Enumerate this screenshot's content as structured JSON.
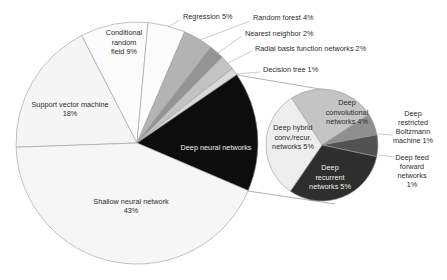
{
  "figure": {
    "background": "#ffffff"
  },
  "chart_data": [
    {
      "type": "pie",
      "name": "machine-learning-methods-main-pie",
      "categories": [
        "Support vector machine",
        "Conditional random field",
        "Regression",
        "Random forest",
        "Nearest neighbor",
        "Radial basis function networks",
        "Decision tree",
        "Deep neural networks",
        "Shallow neural network"
      ],
      "values": [
        18,
        9,
        5,
        4,
        2,
        2,
        1,
        16,
        43
      ],
      "unit": "%",
      "legend": "none",
      "labels_shown": [
        "Support vector machine 18%",
        "Conditional random field 9%",
        "Regression 5%",
        "Random forest 4%",
        "Nearest neighbor 2%",
        "Radial basis function networks 2%",
        "Decision tree 1%",
        "Deep neural networks",
        "Shallow neural network 43%"
      ]
    },
    {
      "type": "pie",
      "name": "deep-neural-networks-breakdown-sub-pie",
      "categories": [
        "Deep convolutional networks",
        "Deep restricted Boltzmann machine",
        "Deep feed forward networks",
        "Deep recurrent networks",
        "Deep hybrid conv./recur. networks"
      ],
      "values": [
        4,
        1,
        1,
        5,
        5
      ],
      "unit": "% of total",
      "legend": "none",
      "labels_shown": [
        "Deep convolutional networks 4%",
        "Deep restricted Boltzmann machine 1%",
        "Deep feed forward networks 1%",
        "Deep recurrent networks 5%",
        "Deep hybrid conv./recur. networks 5%"
      ]
    }
  ],
  "render": {
    "canvas": {
      "width": 447,
      "height": 280
    },
    "slice_stroke": "#9b9b9b",
    "leader_color": "#a8a8a8",
    "connector_color": "#8f8f8f",
    "dark_text": "#2d2d2d",
    "light_text": "#ededed",
    "pies": [
      {
        "name": "main-pie",
        "cx": 137,
        "cy": 143,
        "r": 121,
        "start": 268,
        "total": 100,
        "slices": [
          {
            "id": "support-vector-machine",
            "pct": 18,
            "fill": "#f5f5f5"
          },
          {
            "id": "conditional-random-field",
            "pct": 9,
            "fill": "#fbfbfb"
          },
          {
            "id": "regression",
            "pct": 5,
            "fill": "#fbfbfb"
          },
          {
            "id": "random-forest",
            "pct": 4,
            "fill": "#b3b3b3"
          },
          {
            "id": "nearest-neighbor",
            "pct": 2,
            "fill": "#949494"
          },
          {
            "id": "radial-basis-function-networks",
            "pct": 2,
            "fill": "#c3c3c3"
          },
          {
            "id": "decision-tree",
            "pct": 1,
            "fill": "#dadada"
          },
          {
            "id": "deep-neural-networks",
            "pct": 16,
            "fill": "#0d0d0d"
          },
          {
            "id": "shallow-neural-network",
            "pct": 43,
            "fill": "#f6f6f6"
          }
        ]
      },
      {
        "name": "sub-pie",
        "cx": 322,
        "cy": 145,
        "r": 56,
        "start": 327,
        "total": 16,
        "slices": [
          {
            "id": "deep-convolutional-networks",
            "pct": 4,
            "fill": "#c4c4c4"
          },
          {
            "id": "deep-restricted-boltzmann-machine",
            "pct": 1,
            "fill": "#8f8f8f"
          },
          {
            "id": "deep-feed-forward-networks",
            "pct": 1,
            "fill": "#525252"
          },
          {
            "id": "deep-recurrent-networks",
            "pct": 5,
            "fill": "#2e2e2e"
          },
          {
            "id": "deep-hybrid-networks",
            "pct": 5,
            "fill": "#ededed"
          }
        ]
      }
    ],
    "inside_labels": [
      {
        "id": "support-vector-machine",
        "lines": [
          "Support vector machine",
          "18%"
        ],
        "x": 70,
        "y": 109,
        "color": "#2d2d2d"
      },
      {
        "id": "conditional-random-field",
        "lines": [
          "Conditional",
          "random",
          "field 9%"
        ],
        "x": 124,
        "y": 42,
        "color": "#2d2d2d"
      },
      {
        "id": "shallow-neural-network",
        "lines": [
          "Shallow neural network",
          "43%"
        ],
        "x": 131,
        "y": 206,
        "color": "#2d2d2d"
      },
      {
        "id": "deep-neural-networks",
        "lines": [
          "Deep neural networks"
        ],
        "x": 216,
        "y": 147,
        "color": "#ededed"
      },
      {
        "id": "deep-convolutional-networks",
        "lines": [
          "Deep",
          "convolutional",
          "networks 4%"
        ],
        "x": 347,
        "y": 112,
        "color": "#2d2d2d"
      },
      {
        "id": "deep-hybrid-networks",
        "lines": [
          "Deep hybrid",
          "conv./recur.",
          "networks 5%"
        ],
        "x": 293,
        "y": 137,
        "color": "#2d2d2d"
      },
      {
        "id": "deep-recurrent-networks",
        "lines": [
          "Deep",
          "recurrent",
          "networks 5%"
        ],
        "x": 330,
        "y": 177,
        "color": "#ededed"
      }
    ],
    "callouts": [
      {
        "id": "regression",
        "lines": [
          "Regression 5%"
        ],
        "x": 183,
        "y": 16,
        "anchor": "start",
        "leader": [
          180,
          20,
          168,
          27
        ]
      },
      {
        "id": "random-forest",
        "lines": [
          "Random forest 4%"
        ],
        "x": 253,
        "y": 17,
        "anchor": "start",
        "leader": [
          250,
          21,
          200,
          40
        ]
      },
      {
        "id": "nearest-neighbor",
        "lines": [
          "Nearest neighbor 2%"
        ],
        "x": 245,
        "y": 33,
        "anchor": "start",
        "leader": [
          242,
          36,
          218,
          53
        ]
      },
      {
        "id": "radial-basis-function-networks",
        "lines": [
          "Radial basis function networks 2%"
        ],
        "x": 255,
        "y": 48,
        "anchor": "start",
        "leader": [
          252,
          51,
          228,
          63
        ]
      },
      {
        "id": "decision-tree",
        "lines": [
          "Decision tree 1%"
        ],
        "x": 263,
        "y": 69,
        "anchor": "start",
        "leader": [
          260,
          72,
          236,
          74
        ]
      },
      {
        "id": "deep-restricted-boltzmann-machine",
        "lines": [
          "Deep",
          "restricted",
          "Boltzmann",
          "machine 1%"
        ],
        "x": 413,
        "y": 127,
        "anchor": "middle",
        "leader": [
          393,
          135,
          378,
          134
        ]
      },
      {
        "id": "deep-feed-forward-networks",
        "lines": [
          "Deep feed",
          "forward",
          "networks",
          "1%"
        ],
        "x": 412,
        "y": 171,
        "anchor": "middle",
        "leader": [
          394,
          157,
          379,
          155
        ]
      }
    ],
    "connectors": [
      {
        "id": "top",
        "pts": [
          237,
          75,
          326,
          90
        ]
      },
      {
        "id": "bottom",
        "pts": [
          248,
          191,
          335,
          204
        ]
      }
    ]
  }
}
